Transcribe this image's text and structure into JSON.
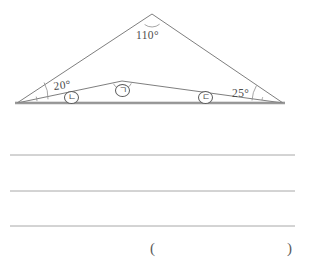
{
  "page": {
    "background_color": "#ffffff",
    "ink_color": "#4a4a4a",
    "line_color": "#999999"
  },
  "figure": {
    "name": "two-overlapping-triangles-on-common-base",
    "stroke_color": "#6b6b6b",
    "baseline_color": "#8c8c8c",
    "angles": [
      {
        "id": "apex-angle",
        "value": "110",
        "unit": "°",
        "display": "110°",
        "position": "outer-triangle-apex",
        "x": 136,
        "y": 30
      },
      {
        "id": "left-base-angle",
        "value": "20",
        "unit": "°",
        "display": "20°",
        "position": "outer-triangle-left-vertex",
        "x": 53,
        "y": 81
      },
      {
        "id": "right-base-angle",
        "value": "25",
        "unit": "°",
        "display": "25°",
        "position": "outer-triangle-right-vertex",
        "x": 232,
        "y": 88
      }
    ],
    "marked_angles": [
      {
        "id": "marked-angle-giyeok",
        "label": "ㄱ",
        "description": "circled-korean-letter-giyeok",
        "position": "inner-triangle-apex",
        "x": 115,
        "y": 84
      },
      {
        "id": "marked-angle-nieun",
        "label": "ㄴ",
        "description": "circled-korean-letter-nieun",
        "position": "inner-triangle-left-vertex",
        "x": 64,
        "y": 91
      },
      {
        "id": "marked-angle-digeut",
        "label": "ㄷ",
        "description": "circled-korean-letter-digeut",
        "position": "inner-triangle-right-vertex",
        "x": 198,
        "y": 91
      }
    ]
  },
  "answer_area": {
    "name": "ruled-answer-lines",
    "line_count": 3,
    "lines": [
      {
        "id": "answer-line-1",
        "y": 155
      },
      {
        "id": "answer-line-2",
        "y": 191
      },
      {
        "id": "answer-line-3",
        "y": 226
      }
    ],
    "bracket": {
      "open": "(",
      "close": ")",
      "open_x": 150,
      "close_x": 287,
      "y": 241
    }
  }
}
